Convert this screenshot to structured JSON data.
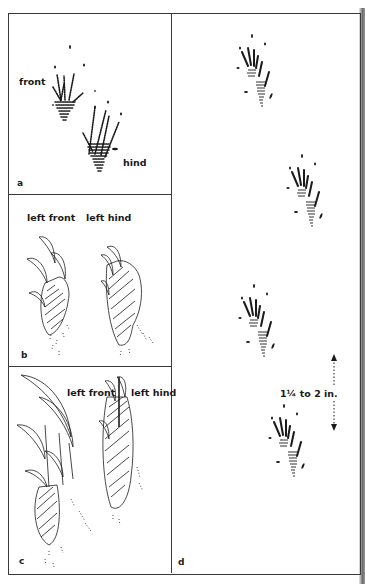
{
  "figure": {
    "panels": {
      "a": {
        "letter": "a",
        "labels": {
          "front": "front",
          "hind": "hind"
        }
      },
      "b": {
        "letter": "b",
        "labels": {
          "left_front": "left front",
          "left_hind": "left hind"
        }
      },
      "c": {
        "letter": "c",
        "labels": {
          "left_front": "left front",
          "left_hind": "left hind"
        }
      },
      "d": {
        "letter": "d",
        "measurement": "1¼ to 2 in."
      }
    },
    "colors": {
      "ink": "#1a1a1a",
      "border": "#3a3a3a",
      "paper": "#ffffff"
    }
  }
}
